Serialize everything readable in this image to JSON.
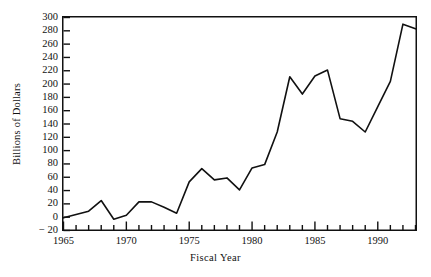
{
  "chart_data": {
    "type": "line",
    "title": "",
    "xlabel": "Fiscal Year",
    "ylabel": "Billions of Dollars",
    "xlim": [
      1965,
      1993
    ],
    "ylim": [
      -20,
      300
    ],
    "grid": false,
    "legend": false,
    "ytick_labels": [
      "300",
      "280",
      "260",
      "240",
      "220",
      "200",
      "180",
      "160",
      "140",
      "120",
      "100",
      "80",
      "60",
      "40",
      "20",
      "0",
      "− 20"
    ],
    "ytick_values": [
      300,
      280,
      260,
      240,
      220,
      200,
      180,
      160,
      140,
      120,
      100,
      80,
      60,
      40,
      20,
      0,
      -20
    ],
    "xtick_labels": [
      "1965",
      "1970",
      "1975",
      "1980",
      "1985",
      "1990"
    ],
    "xtick_values": [
      1965,
      1970,
      1975,
      1980,
      1985,
      1990
    ],
    "xminor_step": 1,
    "series": [
      {
        "name": "Deficit",
        "color": "#111111",
        "x": [
          1965,
          1966,
          1967,
          1968,
          1969,
          1970,
          1971,
          1972,
          1973,
          1974,
          1975,
          1976,
          1977,
          1978,
          1979,
          1980,
          1981,
          1982,
          1983,
          1984,
          1985,
          1986,
          1987,
          1988,
          1989,
          1990,
          1991,
          1992,
          1993
        ],
        "values": [
          -1,
          4,
          9,
          25,
          -3,
          3,
          23,
          23,
          15,
          6,
          53,
          73,
          56,
          59,
          41,
          74,
          79,
          128,
          211,
          185,
          212,
          221,
          148,
          144,
          128,
          166,
          204,
          290,
          283
        ]
      }
    ]
  }
}
